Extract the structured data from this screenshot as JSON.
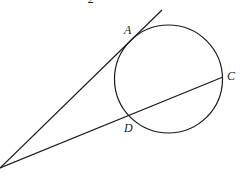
{
  "diagram": {
    "top_partial_label": "2",
    "points": {
      "A": {
        "label": "A",
        "x": 138,
        "y": 32
      },
      "C": {
        "label": "C",
        "x": 222,
        "y": 77
      },
      "D": {
        "label": "D",
        "x": 129,
        "y": 115
      },
      "vertex": {
        "x": 0,
        "y": 168
      }
    },
    "circle": {
      "cx": 168.5,
      "cy": 79,
      "r": 54
    },
    "lines": [
      {
        "name": "tangent",
        "from": "vertex",
        "to_x": 162,
        "to_y": 10
      },
      {
        "name": "secant",
        "from": "vertex",
        "to": "C"
      }
    ],
    "colors": {
      "stroke": "#1a1a1a",
      "background": "#ffffff"
    }
  }
}
